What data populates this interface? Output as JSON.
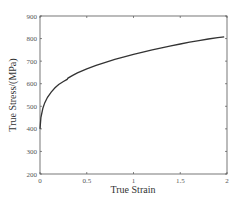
{
  "chart_data": {
    "type": "line",
    "title": "",
    "xlabel": "True Strain",
    "ylabel": "True Stress/(MPa)",
    "xlim": [
      0,
      2
    ],
    "ylim": [
      200,
      900
    ],
    "xticks": [
      0,
      0.5,
      1,
      1.5,
      2
    ],
    "xtick_labels": [
      "0",
      "0.5",
      "1",
      "1.5",
      "2"
    ],
    "yticks": [
      200,
      300,
      400,
      500,
      600,
      700,
      800,
      900
    ],
    "ytick_labels": [
      "200",
      "300",
      "400",
      "500",
      "600",
      "700",
      "800",
      "900"
    ],
    "grid": false,
    "legend": null,
    "series": [
      {
        "name": "True stress-strain curve",
        "color": "#333333",
        "x": [
          0,
          0.01,
          0.03,
          0.05,
          0.08,
          0.12,
          0.16,
          0.2,
          0.25,
          0.29,
          0.3,
          0.35,
          0.4,
          0.5,
          0.6,
          0.7,
          0.8,
          0.9,
          1.0,
          1.1,
          1.2,
          1.3,
          1.4,
          1.5,
          1.6,
          1.7,
          1.8,
          1.9,
          1.97
        ],
        "y": [
          400,
          450,
          490,
          515,
          540,
          563,
          582,
          597,
          610,
          619,
          625,
          637,
          648,
          666,
          681,
          695,
          708,
          719,
          730,
          740,
          750,
          759,
          768,
          776,
          784,
          791,
          798,
          804,
          808
        ]
      }
    ]
  }
}
